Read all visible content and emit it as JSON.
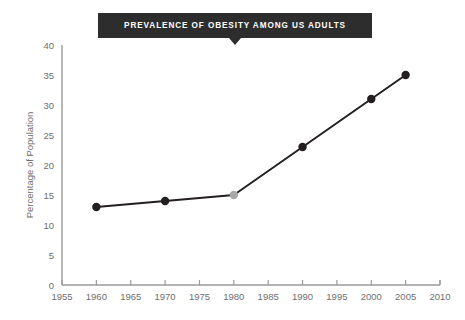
{
  "title": {
    "text": "PREVALENCE OF OBESITY AMONG US ADULTS"
  },
  "colors": {
    "banner_background": "#2d2d2d",
    "banner_text": "#ffffff",
    "line": "#231f20",
    "marker": "#231f20",
    "marker_highlight": "#a8a8a8",
    "axis": "#9a9a9a",
    "tick_text": "#6e6e6e",
    "background": "#ffffff"
  },
  "chart_data": {
    "type": "line",
    "title": "PREVALENCE OF OBESITY AMONG US ADULTS",
    "xlabel": "",
    "ylabel": "Percentage of Population",
    "xlim": [
      1955,
      2010
    ],
    "ylim": [
      0,
      40
    ],
    "xticks": [
      1955,
      1960,
      1965,
      1970,
      1975,
      1980,
      1985,
      1990,
      1995,
      2000,
      2005,
      2010
    ],
    "yticks": [
      0,
      5,
      10,
      15,
      20,
      25,
      30,
      35,
      40
    ],
    "xtick_labels": [
      "1955",
      "1960",
      "1965",
      "1970",
      "1975",
      "1980",
      "1985",
      "1990",
      "1995",
      "2000",
      "2005",
      "2010"
    ],
    "ytick_labels": [
      "0",
      "5",
      "10",
      "15",
      "20",
      "25",
      "30",
      "35",
      "40"
    ],
    "grid": false,
    "legend": false,
    "x": [
      1960,
      1970,
      1980,
      1990,
      2000,
      2005
    ],
    "values": [
      13,
      14,
      15,
      23,
      31,
      35
    ],
    "points": [
      {
        "x": 1960,
        "y": 13,
        "highlight": false
      },
      {
        "x": 1970,
        "y": 14,
        "highlight": false
      },
      {
        "x": 1980,
        "y": 15,
        "highlight": true
      },
      {
        "x": 1990,
        "y": 23,
        "highlight": false
      },
      {
        "x": 2000,
        "y": 31,
        "highlight": false
      },
      {
        "x": 2005,
        "y": 35,
        "highlight": false
      }
    ]
  }
}
